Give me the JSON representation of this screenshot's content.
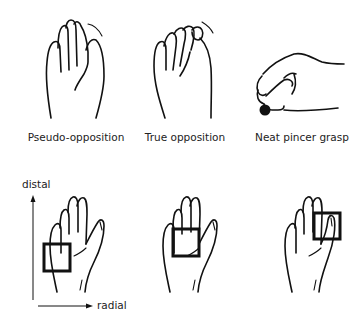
{
  "figure": {
    "top_row": [
      {
        "id": "pseudo-opposition",
        "label": "Pseudo-opposition"
      },
      {
        "id": "true-opposition",
        "label": "True opposition"
      },
      {
        "id": "neat-pincer-grasp",
        "label": "Neat pincer grasp"
      }
    ],
    "bottom_row": {
      "axes": {
        "vertical_label": "distal",
        "horizontal_label": "radial"
      },
      "panels": [
        {
          "id": "ulnar-proximal-box",
          "box_position": "ulnar-proximal palm"
        },
        {
          "id": "center-palm-box",
          "box_position": "central palm"
        },
        {
          "id": "radial-distal-box",
          "box_position": "radial-distal (thumb)"
        }
      ]
    },
    "colors": {
      "line": "#111111",
      "background": "#ffffff",
      "text": "#222222"
    }
  }
}
